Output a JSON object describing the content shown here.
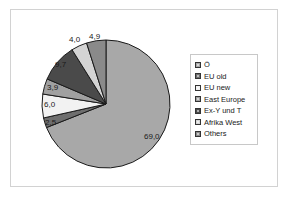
{
  "chart_data": {
    "type": "pie",
    "title": "",
    "subtitle": "",
    "xlabel": "",
    "ylabel": "",
    "grid": false,
    "legend_position": "right",
    "start_angle_deg": 0,
    "direction": "clockwise",
    "decimal_separator": ",",
    "categories": [
      "Ö",
      "EU old",
      "EU new",
      "East Europe",
      "Ex-Y und T",
      "Afrika West",
      "Others"
    ],
    "values": [
      69.0,
      2.5,
      6.0,
      3.9,
      9.7,
      4.0,
      4.9
    ],
    "data_labels": [
      "69,0",
      "2,5",
      "6,0",
      "3,9",
      "9,7",
      "4,0",
      "4,9"
    ],
    "colors": [
      "#a8a8a8",
      "#6e6e6e",
      "#f2f2f2",
      "#a0a0a0",
      "#4a4a4a",
      "#d4d4d4",
      "#8a8a8a"
    ],
    "slice_edge_color": "#1a1a1a",
    "annotations": []
  },
  "legend": {
    "items": [
      {
        "label": "Ö",
        "color": "#a8a8a8"
      },
      {
        "label": "EU old",
        "color": "#6e6e6e"
      },
      {
        "label": "EU new",
        "color": "#f2f2f2"
      },
      {
        "label": "East Europe",
        "color": "#a0a0a0"
      },
      {
        "label": "Ex-Y und T",
        "color": "#4a4a4a"
      },
      {
        "label": "Afrika West",
        "color": "#d4d4d4"
      },
      {
        "label": "Others",
        "color": "#8a8a8a"
      }
    ]
  },
  "labels": {
    "slice_0": "69,0",
    "slice_1": "2,5",
    "slice_2": "6,0",
    "slice_3": "3,9",
    "slice_4": "9,7",
    "slice_5": "4,0",
    "slice_6": "4,9"
  },
  "style": {
    "background": "#ffffff",
    "frame_color": "#d2d2d2",
    "text_color": "#1a1a1a"
  }
}
